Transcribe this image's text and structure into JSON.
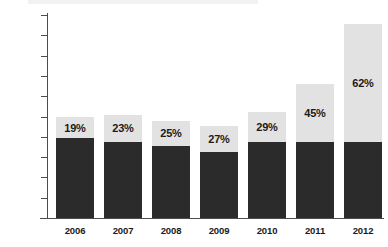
{
  "chart_data": {
    "type": "bar",
    "subtype": "stacked-bar",
    "title": "",
    "subtitle": "",
    "xlabel": "",
    "ylabel": "",
    "categories": [
      "2006",
      "2007",
      "2008",
      "2009",
      "2010",
      "2011",
      "2012"
    ],
    "ylim": [
      0,
      5000
    ],
    "ytick_values": [
      0,
      500,
      1000,
      1500,
      2000,
      2500,
      3000,
      3500,
      4000,
      4500,
      5000
    ],
    "ytick_labels": [
      "0",
      "500",
      "1000",
      "1500",
      "2000",
      "2500",
      "3000",
      "3500",
      "4000",
      "4500",
      "5000"
    ],
    "grid": false,
    "legend": "none",
    "series": [
      {
        "name": "lower-segment",
        "color": "#2b2b2b",
        "values": [
          1970,
          1870,
          1780,
          1630,
          1880,
          1870,
          1880
        ]
      },
      {
        "name": "upper-segment",
        "color": "#e2e2e2",
        "values": [
          510,
          670,
          610,
          630,
          740,
          1420,
          2900
        ]
      }
    ],
    "totals": [
      2480,
      2540,
      2390,
      2260,
      2620,
      3290,
      4780
    ],
    "data_labels": [
      "19%",
      "23%",
      "25%",
      "27%",
      "29%",
      "45%",
      "62%"
    ],
    "colors": {
      "lower": "#2b2b2b",
      "upper": "#e2e2e2",
      "axis": "#4c4c4c",
      "text": "#1a1a1a",
      "background": "#ffffff"
    }
  }
}
